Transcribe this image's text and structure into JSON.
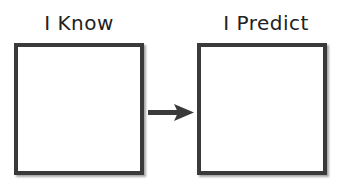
{
  "diagram": {
    "left": {
      "label": "I Know"
    },
    "right": {
      "label": "I Predict"
    },
    "arrow": {
      "direction": "right",
      "color": "#3a3a3a"
    }
  }
}
